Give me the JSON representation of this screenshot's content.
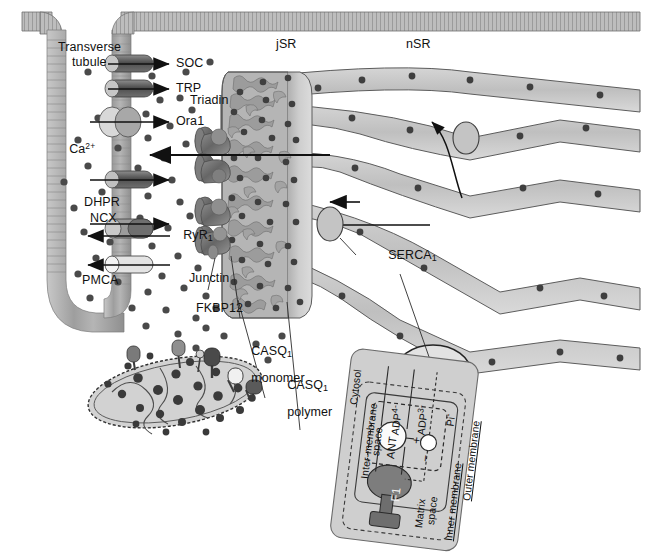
{
  "figure": {
    "type": "diagram",
    "palette": {
      "membrane_gray": "#9a9a9a",
      "sr_lumen_light": "#e3e3e3",
      "sr_fill_mid": "#c9c9c9",
      "jsr_fill": "#bdbdbd",
      "calcium_dot": "#4d4d4d",
      "outline": "#3a3a3a",
      "ryr_dark": "#6e6e6e",
      "mito_panel": "#cfcfcf",
      "f1_dark": "#6b6b6b",
      "white": "#ffffff"
    }
  },
  "compartments": {
    "jsr": "jSR",
    "nsr": "nSR"
  },
  "labels": {
    "transverse_tubule_line1": "Transverse",
    "transverse_tubule_line2": "tubule",
    "soc": "SOC",
    "trp": "TRP",
    "triadin": "Triadin",
    "orai1": "Ora1",
    "calcium": "Ca",
    "calcium_charge": "2+",
    "dhpr": "DHPR",
    "ncx": "NCX",
    "ryr_base": "RyR",
    "ryr_sub": "1",
    "pmca": "PMCA",
    "junctin": "Junctin",
    "fkbp12": "FKBP12",
    "casq_monomer_line1": "CASQ",
    "casq_monomer_sub": "1",
    "casq_monomer_line2": "monomer",
    "casq_polymer_line1": "CASQ",
    "casq_polymer_sub": "1",
    "casq_polymer_line2": "polymer",
    "serca_base": "SERCA",
    "serca_sub": "1"
  },
  "mitochondrion_inset": {
    "cytosol": "Cytosol",
    "intermembrane_space_line1": "Inter-membrane",
    "intermembrane_space_line2": "space",
    "outer_membrane": "Outer membrane",
    "inner_membrane": "Inner membrane",
    "matrix_line1": "Matrix",
    "matrix_line2": "space",
    "adp4": "ADP",
    "adp4_sup": "4-",
    "adp3": "ADP",
    "adp3_sup": "3-",
    "pi": "Pi",
    "pi_sup": "-",
    "ant": "ANT",
    "f1": "F1",
    "plus": "+",
    "minus": "−"
  },
  "channels": [
    {
      "name": "SOC",
      "direction": "inward"
    },
    {
      "name": "TRP",
      "direction": "inward"
    },
    {
      "name": "Ora1",
      "direction": "inward"
    },
    {
      "name": "DHPR",
      "direction": "inward"
    },
    {
      "name": "NCX",
      "direction": "bidirectional"
    },
    {
      "name": "PMCA",
      "direction": "outward"
    }
  ]
}
